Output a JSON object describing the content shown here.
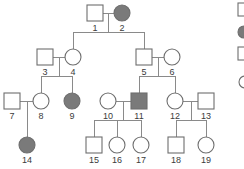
{
  "figure": {
    "type": "pedigree-chart",
    "background_color": "#ffffff",
    "line_color": "#8a8a8a",
    "symbol_outline_color": "#6e6e6e",
    "affected_fill_color": "#7a7a7a",
    "unaffected_fill_color": "#ffffff",
    "label_color": "#3b3b3b"
  },
  "individuals": [
    {
      "id": "1",
      "label": "1",
      "sex": "male",
      "shape": "square",
      "status": "unaffected",
      "generation": 1,
      "x": 95,
      "y": 13
    },
    {
      "id": "2",
      "label": "2",
      "sex": "female",
      "shape": "circle",
      "status": "affected",
      "generation": 1,
      "x": 122,
      "y": 13
    },
    {
      "id": "3",
      "label": "3",
      "sex": "male",
      "shape": "square",
      "status": "unaffected",
      "generation": 2,
      "x": 45,
      "y": 57
    },
    {
      "id": "4",
      "label": "4",
      "sex": "female",
      "shape": "circle",
      "status": "unaffected",
      "generation": 2,
      "x": 73,
      "y": 57
    },
    {
      "id": "5",
      "label": "5",
      "sex": "male",
      "shape": "square",
      "status": "unaffected",
      "generation": 2,
      "x": 144,
      "y": 57
    },
    {
      "id": "6",
      "label": "6",
      "sex": "female",
      "shape": "circle",
      "status": "unaffected",
      "generation": 2,
      "x": 172,
      "y": 57
    },
    {
      "id": "7",
      "label": "7",
      "sex": "male",
      "shape": "square",
      "status": "unaffected",
      "generation": 3,
      "x": 12,
      "y": 101
    },
    {
      "id": "8",
      "label": "8",
      "sex": "female",
      "shape": "circle",
      "status": "unaffected",
      "generation": 3,
      "x": 41,
      "y": 101
    },
    {
      "id": "9",
      "label": "9",
      "sex": "female",
      "shape": "circle",
      "status": "affected",
      "generation": 3,
      "x": 72,
      "y": 101
    },
    {
      "id": "10",
      "label": "10",
      "sex": "female",
      "shape": "circle",
      "status": "unaffected",
      "generation": 3,
      "x": 108,
      "y": 101
    },
    {
      "id": "11",
      "label": "11",
      "sex": "male",
      "shape": "square",
      "status": "affected",
      "generation": 3,
      "x": 139,
      "y": 101
    },
    {
      "id": "12",
      "label": "12",
      "sex": "female",
      "shape": "circle",
      "status": "unaffected",
      "generation": 3,
      "x": 175,
      "y": 101
    },
    {
      "id": "13",
      "label": "13",
      "sex": "male",
      "shape": "square",
      "status": "unaffected",
      "generation": 3,
      "x": 206,
      "y": 101
    },
    {
      "id": "14",
      "label": "14",
      "sex": "female",
      "shape": "circle",
      "status": "affected",
      "generation": 4,
      "x": 27,
      "y": 145
    },
    {
      "id": "15",
      "label": "15",
      "sex": "male",
      "shape": "square",
      "status": "unaffected",
      "generation": 4,
      "x": 94,
      "y": 145
    },
    {
      "id": "16",
      "label": "16",
      "sex": "female",
      "shape": "circle",
      "status": "unaffected",
      "generation": 4,
      "x": 117,
      "y": 145
    },
    {
      "id": "17",
      "label": "17",
      "sex": "female",
      "shape": "circle",
      "status": "unaffected",
      "generation": 4,
      "x": 141,
      "y": 145
    },
    {
      "id": "18",
      "label": "18",
      "sex": "male",
      "shape": "square",
      "status": "unaffected",
      "generation": 4,
      "x": 176,
      "y": 145
    },
    {
      "id": "19",
      "label": "19",
      "sex": "female",
      "shape": "circle",
      "status": "unaffected",
      "generation": 4,
      "x": 206,
      "y": 145
    }
  ],
  "matings": [
    {
      "partners": [
        "1",
        "2"
      ],
      "children": [
        "4",
        "5"
      ]
    },
    {
      "partners": [
        "3",
        "4"
      ],
      "children": [
        "8",
        "9"
      ]
    },
    {
      "partners": [
        "5",
        "6"
      ],
      "children": [
        "11",
        "12"
      ]
    },
    {
      "partners": [
        "7",
        "8"
      ],
      "children": [
        "14"
      ]
    },
    {
      "partners": [
        "10",
        "11"
      ],
      "children": [
        "15",
        "16",
        "17"
      ]
    },
    {
      "partners": [
        "12",
        "13"
      ],
      "children": [
        "18",
        "19"
      ]
    }
  ],
  "legend": {
    "visible": false,
    "note": "legend symbols cropped at right edge",
    "items": [
      {
        "symbol": "square-partial",
        "x": 236,
        "y": 6
      },
      {
        "symbol": "circle-filled-partial",
        "x": 236,
        "y": 32
      },
      {
        "symbol": "square-partial",
        "x": 236,
        "y": 52
      },
      {
        "symbol": "circle-partial",
        "x": 236,
        "y": 82
      }
    ]
  }
}
